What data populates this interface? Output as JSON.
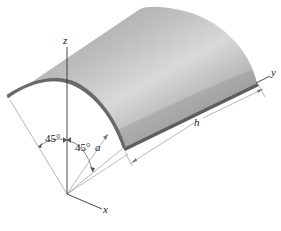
{
  "figure": {
    "axes": {
      "z_label": "z",
      "y_label": "y",
      "x_label": "x"
    },
    "angles": {
      "left_angle_label": "45°",
      "right_angle_label": "45°"
    },
    "dimensions": {
      "radius_label": "a",
      "length_label": "h"
    },
    "colors": {
      "shell_light": "#d6d6d6",
      "shell_mid": "#a8a8a8",
      "shell_dark": "#7a7a7a",
      "shell_edge": "#5a5a5a",
      "axis_line": "#333333",
      "construction_line": "#9a9a9a",
      "label": "#222222"
    }
  }
}
